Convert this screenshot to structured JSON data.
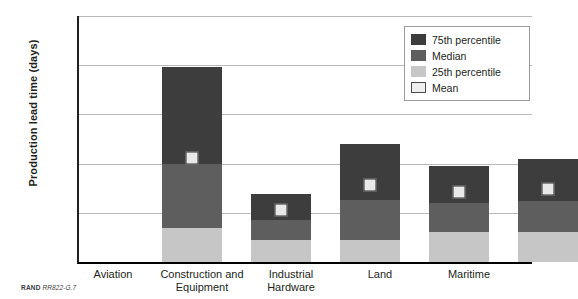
{
  "chart_data": {
    "type": "bar",
    "title": "",
    "xlabel": "",
    "ylabel": "Production lead time (days)",
    "ylim": [
      0,
      250
    ],
    "yticks": [
      0,
      50,
      100,
      150,
      200,
      250
    ],
    "grid": true,
    "legend_position": "top-right",
    "categories": [
      "Aviation",
      "Construction and Equipment",
      "Industrial Hardware",
      "Land",
      "Maritime"
    ],
    "series": [
      {
        "name": "25th percentile",
        "values": [
          35,
          22,
          22,
          30,
          30
        ],
        "color": "#c6c6c6"
      },
      {
        "name": "Median",
        "values": [
          100,
          43,
          63,
          60,
          62
        ],
        "color": "#5e5e5e"
      },
      {
        "name": "75th percentile",
        "values": [
          198,
          69,
          120,
          98,
          105
        ],
        "color": "#3d3d3d"
      },
      {
        "name": "Mean",
        "values": [
          106,
          53,
          78,
          71,
          74
        ],
        "color": "#e8e8e8"
      }
    ]
  },
  "axis": {
    "y_title": "Production lead time (days)",
    "y_tick_labels": [
      "250",
      "200",
      "150",
      "100",
      "50",
      "0"
    ],
    "x_tick_labels": [
      "Aviation",
      "Construction and\nEquipment",
      "Industrial\nHardware",
      "Land",
      "Maritime"
    ]
  },
  "legend": {
    "items": [
      {
        "label": "75th percentile",
        "swatch": "dark-gray"
      },
      {
        "label": "Median",
        "swatch": "medium-gray"
      },
      {
        "label": "25th percentile",
        "swatch": "light-gray"
      },
      {
        "label": "Mean",
        "swatch": "white-outlined"
      }
    ]
  },
  "footer": {
    "org": "RAND",
    "figure_code": "RR822-G.7"
  }
}
